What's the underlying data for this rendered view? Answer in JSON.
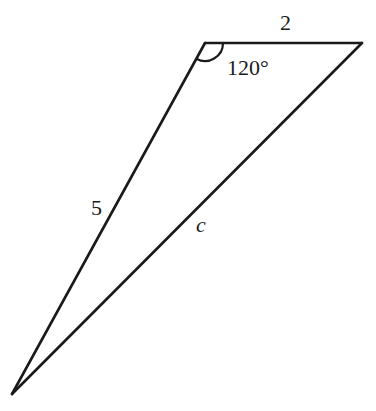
{
  "diagram": {
    "type": "triangle",
    "vertices": {
      "A": {
        "x": 205,
        "y": 43
      },
      "B": {
        "x": 362,
        "y": 43
      },
      "C": {
        "x": 12,
        "y": 394
      }
    },
    "sides": [
      {
        "id": "AB",
        "label": "2",
        "italic": false
      },
      {
        "id": "AC",
        "label": "5",
        "italic": false
      },
      {
        "id": "BC",
        "label": "c",
        "italic": true
      }
    ],
    "angle": {
      "vertex": "A",
      "label": "120°"
    },
    "colors": {
      "stroke": "#1a1a1a",
      "background": "#ffffff"
    }
  },
  "labels": {
    "side_ab": "2",
    "side_ac": "5",
    "side_bc": "c",
    "angle_a": "120°"
  }
}
